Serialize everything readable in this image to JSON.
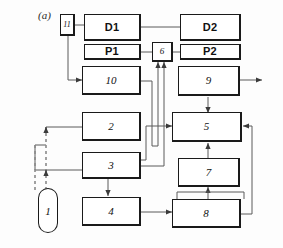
{
  "figure": {
    "caption_label": "(a)",
    "type": "block-diagram",
    "background_color": "#fdfdfd",
    "line_color": "#555555",
    "block_border_color": "#1a1a1a"
  },
  "blocks": [
    {
      "id": "11",
      "label": "11",
      "shape": "rect",
      "style": "italic-numeral"
    },
    {
      "id": "D1",
      "label": "D1",
      "shape": "rect",
      "style": "upright-bold"
    },
    {
      "id": "D2",
      "label": "D2",
      "shape": "rect",
      "style": "upright-bold"
    },
    {
      "id": "P1",
      "label": "P1",
      "shape": "rect",
      "style": "upright-bold"
    },
    {
      "id": "P2",
      "label": "P2",
      "shape": "rect",
      "style": "upright-bold"
    },
    {
      "id": "6",
      "label": "6",
      "shape": "rect",
      "style": "italic-numeral"
    },
    {
      "id": "10",
      "label": "10",
      "shape": "rect",
      "style": "italic-numeral"
    },
    {
      "id": "9",
      "label": "9",
      "shape": "rect",
      "style": "italic-numeral"
    },
    {
      "id": "2",
      "label": "2",
      "shape": "rect",
      "style": "italic-numeral"
    },
    {
      "id": "5",
      "label": "5",
      "shape": "rect",
      "style": "italic-numeral"
    },
    {
      "id": "3",
      "label": "3",
      "shape": "rect",
      "style": "italic-numeral"
    },
    {
      "id": "7",
      "label": "7",
      "shape": "rect",
      "style": "italic-numeral"
    },
    {
      "id": "1",
      "label": "1",
      "shape": "oval",
      "style": "italic-numeral"
    },
    {
      "id": "4",
      "label": "4",
      "shape": "rect",
      "style": "italic-numeral"
    },
    {
      "id": "8",
      "label": "8",
      "shape": "rect",
      "style": "italic-numeral"
    }
  ],
  "connections": [
    {
      "from": "11",
      "to": "D1",
      "arrow": false,
      "dashed": false
    },
    {
      "from": "D1",
      "to": "D2",
      "arrow": false,
      "dashed": false
    },
    {
      "from": "11",
      "to": "10",
      "arrow": true,
      "dashed": false
    },
    {
      "from": "P1",
      "to": "6",
      "arrow": false,
      "dashed": false
    },
    {
      "from": "6",
      "to": "P2",
      "arrow": false,
      "dashed": false
    },
    {
      "from": "10",
      "to": "6",
      "arrow": true,
      "dashed": false
    },
    {
      "from": "3",
      "to": "6",
      "arrow": true,
      "dashed": false
    },
    {
      "from": "9",
      "to": "out",
      "arrow": true,
      "dashed": false
    },
    {
      "from": "9",
      "to": "5",
      "arrow": true,
      "dashed": false
    },
    {
      "from": "7",
      "to": "5",
      "arrow": true,
      "dashed": false
    },
    {
      "from": "8",
      "to": "7",
      "arrow": true,
      "dashed": false
    },
    {
      "from": "8",
      "to": "5",
      "arrow": true,
      "dashed": false
    },
    {
      "from": "3",
      "to": "5",
      "arrow": true,
      "dashed": false
    },
    {
      "from": "3",
      "to": "4",
      "arrow": true,
      "dashed": false
    },
    {
      "from": "4",
      "to": "8",
      "arrow": true,
      "dashed": false
    },
    {
      "from": "2",
      "to": "1",
      "arrow": true,
      "dashed": true
    },
    {
      "from": "3",
      "to": "1",
      "arrow": true,
      "dashed": true
    }
  ]
}
